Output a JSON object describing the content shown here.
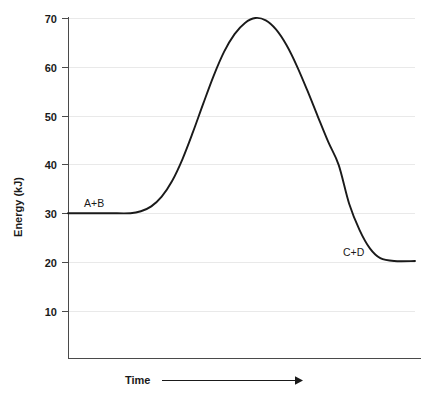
{
  "chart_data": {
    "type": "line",
    "title": "",
    "subtitle": "",
    "xlabel": "Time",
    "ylabel": "Energy (kJ)",
    "grid": true,
    "legend_position": "none",
    "xlim": [
      0,
      100
    ],
    "ylim": [
      0,
      70
    ],
    "y_ticks": [
      10,
      20,
      30,
      40,
      50,
      60,
      70
    ],
    "y_tick_labels": [
      "10",
      "20",
      "30",
      "40",
      "50",
      "60",
      "70"
    ],
    "x_ticks": [],
    "x_tick_labels": [],
    "x_axis_arrow": true,
    "series": [
      {
        "name": "reaction-energy-profile",
        "color": "#1a1a1a",
        "x": [
          0,
          6,
          12,
          18,
          21,
          24,
          27,
          30,
          33,
          36,
          39,
          42,
          45,
          48,
          51,
          54,
          57,
          60,
          63,
          66,
          69,
          72,
          75,
          78,
          81,
          84,
          87,
          90,
          94,
          100
        ],
        "values": [
          30,
          30,
          30,
          30,
          30.4,
          31.4,
          33.4,
          36.6,
          41.1,
          46.6,
          52.5,
          58.2,
          63.1,
          66.7,
          69.0,
          70.0,
          69.5,
          67.6,
          64.4,
          60.1,
          55.1,
          49.8,
          44.6,
          39.9,
          32.0,
          26.6,
          22.8,
          20.8,
          20.2,
          20.2
        ]
      }
    ],
    "annotations": [
      {
        "text": "A+B",
        "x_value": 10,
        "y_value": 30,
        "energy_kJ": 30,
        "role": "reactants"
      },
      {
        "text": "C+D",
        "x_value": 88,
        "y_value": 20,
        "energy_kJ": 20,
        "role": "products"
      }
    ],
    "key_points": {
      "reactant_energy": 30,
      "peak_energy": 70,
      "product_energy": 20,
      "activation_energy": 40,
      "energy_change": -10
    },
    "colors": {
      "curve": "#1a1a1a",
      "gridline": "#e9e9e9",
      "axis": "#4a4a4a",
      "text": "#1a1a1a",
      "background": "#ffffff"
    }
  }
}
